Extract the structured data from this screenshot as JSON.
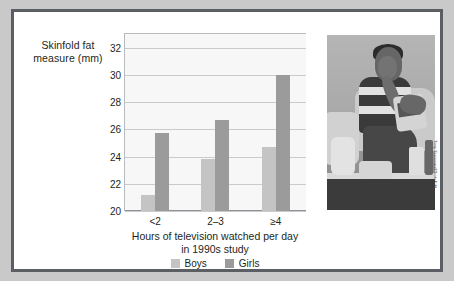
{
  "figure": {
    "border_color": "#5b5e63",
    "background": "#ffffff",
    "page_background": "#c9c9c9"
  },
  "chart_data": {
    "type": "bar",
    "title": "",
    "xlabel_lines": [
      "Hours of television watched per day",
      "in 1990s study"
    ],
    "ylabel_lines": [
      "Skinfold fat",
      "measure (mm)"
    ],
    "categories": [
      "<2",
      "2–3",
      "≥4"
    ],
    "series": [
      {
        "name": "Boys",
        "color": "#c4c4c4",
        "values": [
          21.2,
          23.8,
          24.7
        ]
      },
      {
        "name": "Girls",
        "color": "#9b9b9b",
        "values": [
          25.7,
          26.7,
          30.0
        ]
      }
    ],
    "ylim": [
      20,
      33
    ],
    "yticks": [
      20,
      22,
      24,
      26,
      28,
      30,
      32
    ],
    "grid": true,
    "legend_position": "bottom-center"
  },
  "photo": {
    "alt": "Boy sitting on a couch eating snacks while watching television",
    "credit": "Tony Freeman/PhotoEdit"
  }
}
